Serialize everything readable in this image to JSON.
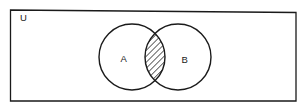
{
  "diagram": {
    "type": "venn",
    "universe_label": "U",
    "sets": [
      {
        "label": "A"
      },
      {
        "label": "B"
      }
    ],
    "shaded_region": "A ∩ B",
    "shading_style": "diagonal-hatch",
    "colors": {
      "stroke": "#1a1a1a",
      "background": "#ffffff"
    }
  }
}
